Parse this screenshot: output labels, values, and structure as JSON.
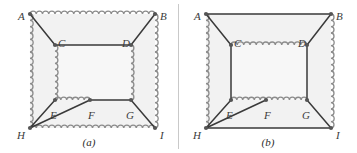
{
  "figure": {
    "type": "geometry-diagram",
    "background_color": "#ffffff",
    "interior_fill": "#f2f2f2",
    "straight_line_color": "#3a3a3a",
    "wavy_line_color": "#8c8c8c",
    "vertex_dot_color": "#555555",
    "label_color": "#3b3b3b"
  },
  "panels": [
    {
      "id": "a",
      "caption": "(a)",
      "vertices": [
        {
          "name": "A",
          "x": 30,
          "y": 14,
          "label_x": 18,
          "label_y": 12
        },
        {
          "name": "B",
          "x": 155,
          "y": 14,
          "label_x": 160,
          "label_y": 12
        },
        {
          "name": "C",
          "x": 55,
          "y": 45,
          "label_x": 58,
          "label_y": 39
        },
        {
          "name": "D",
          "x": 131,
          "y": 45,
          "label_x": 122,
          "label_y": 39
        },
        {
          "name": "E",
          "x": 55,
          "y": 100,
          "label_x": 50,
          "label_y": 111
        },
        {
          "name": "F",
          "x": 90,
          "y": 100,
          "label_x": 88,
          "label_y": 111
        },
        {
          "name": "G",
          "x": 131,
          "y": 100,
          "label_x": 126,
          "label_y": 111
        },
        {
          "name": "H",
          "x": 30,
          "y": 128,
          "label_x": 17,
          "label_y": 131
        },
        {
          "name": "I",
          "x": 155,
          "y": 128,
          "label_x": 160,
          "label_y": 131
        }
      ],
      "wavy_edges": [
        {
          "from": "A",
          "to": "B"
        },
        {
          "from": "A",
          "to": "H"
        },
        {
          "from": "B",
          "to": "I"
        },
        {
          "from": "H",
          "to": "I"
        },
        {
          "from": "C",
          "to": "E"
        },
        {
          "from": "D",
          "to": "G"
        },
        {
          "from": "E",
          "to": "F"
        }
      ],
      "straight_edges": [
        {
          "from": "A",
          "to": "C"
        },
        {
          "from": "B",
          "to": "D"
        },
        {
          "from": "C",
          "to": "D"
        },
        {
          "from": "F",
          "to": "G"
        },
        {
          "from": "H",
          "to": "E"
        },
        {
          "from": "H",
          "to": "F"
        },
        {
          "from": "G",
          "to": "I"
        }
      ]
    },
    {
      "id": "b",
      "caption": "(b)",
      "vertices": [
        {
          "name": "A",
          "x": 27,
          "y": 14,
          "label_x": 15,
          "label_y": 12
        },
        {
          "name": "B",
          "x": 152,
          "y": 14,
          "label_x": 157,
          "label_y": 12
        },
        {
          "name": "C",
          "x": 52,
          "y": 45,
          "label_x": 55,
          "label_y": 39
        },
        {
          "name": "D",
          "x": 128,
          "y": 45,
          "label_x": 119,
          "label_y": 39
        },
        {
          "name": "E",
          "x": 52,
          "y": 100,
          "label_x": 47,
          "label_y": 111
        },
        {
          "name": "F",
          "x": 87,
          "y": 100,
          "label_x": 85,
          "label_y": 111
        },
        {
          "name": "G",
          "x": 128,
          "y": 100,
          "label_x": 123,
          "label_y": 111
        },
        {
          "name": "H",
          "x": 27,
          "y": 128,
          "label_x": 14,
          "label_y": 131
        },
        {
          "name": "I",
          "x": 152,
          "y": 128,
          "label_x": 157,
          "label_y": 131
        }
      ],
      "wavy_edges": [
        {
          "from": "A",
          "to": "H"
        },
        {
          "from": "B",
          "to": "I"
        },
        {
          "from": "C",
          "to": "D"
        },
        {
          "from": "E",
          "to": "F"
        },
        {
          "from": "F",
          "to": "G"
        }
      ],
      "straight_edges": [
        {
          "from": "A",
          "to": "B"
        },
        {
          "from": "H",
          "to": "I"
        },
        {
          "from": "A",
          "to": "C"
        },
        {
          "from": "B",
          "to": "D"
        },
        {
          "from": "C",
          "to": "E"
        },
        {
          "from": "D",
          "to": "G"
        },
        {
          "from": "H",
          "to": "E"
        },
        {
          "from": "H",
          "to": "F"
        },
        {
          "from": "G",
          "to": "I"
        }
      ]
    }
  ]
}
